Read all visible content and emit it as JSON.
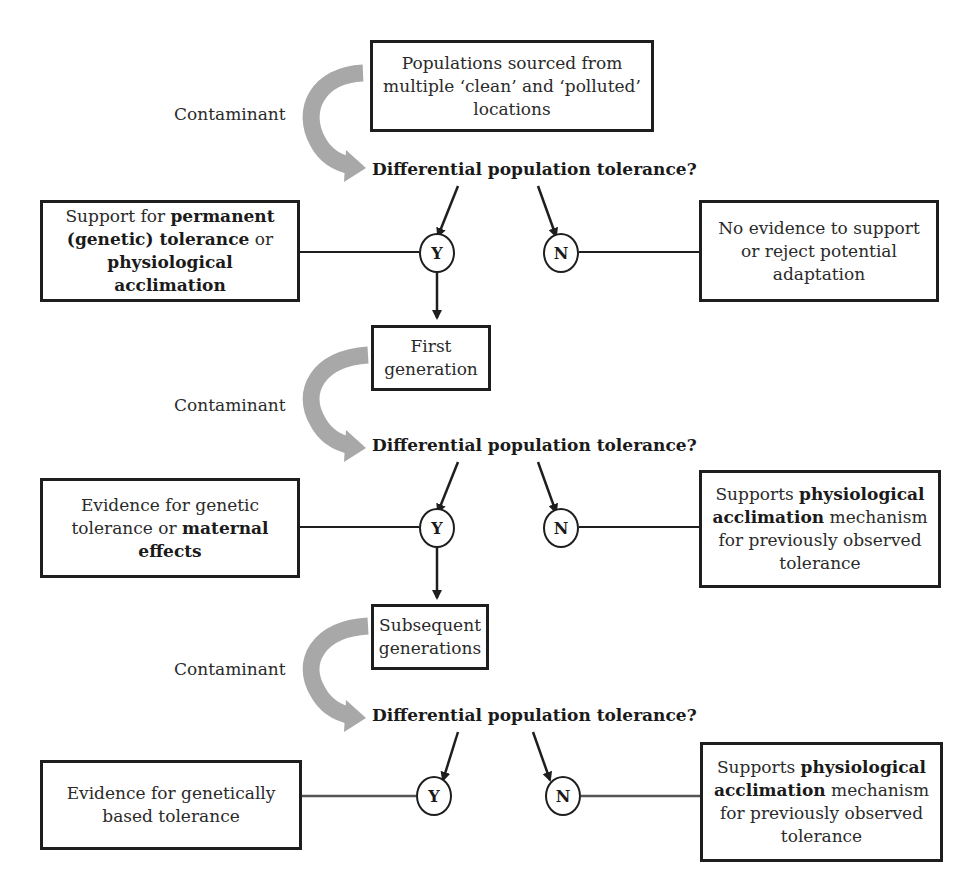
{
  "colors": {
    "line": "#1e1e1e",
    "curved_arrow": "#a8a8a8",
    "text": "#2a2a2a",
    "background": "#ffffff"
  },
  "stages": [
    {
      "source_box": {
        "parts": [
          {
            "text": "Populations sourced from multiple ‘clean’ and ‘polluted’ locations",
            "bold": false
          }
        ]
      },
      "treatment_label": "Contaminant",
      "question": "Differential population tolerance?",
      "yes_node": "Y",
      "no_node": "N",
      "yes_outcome": {
        "parts": [
          {
            "text": "Support for ",
            "bold": false
          },
          {
            "text": "permanent (genetic) tolerance",
            "bold": true
          },
          {
            "text": " or ",
            "bold": false
          },
          {
            "text": "physiological acclimation",
            "bold": true
          }
        ]
      },
      "no_outcome": {
        "parts": [
          {
            "text": "No evidence to support or reject potential adaptation",
            "bold": false
          }
        ]
      }
    },
    {
      "source_box": {
        "parts": [
          {
            "text": "First generation",
            "bold": false
          }
        ]
      },
      "treatment_label": "Contaminant",
      "question": "Differential population tolerance?",
      "yes_node": "Y",
      "no_node": "N",
      "yes_outcome": {
        "parts": [
          {
            "text": "Evidence for genetic tolerance or ",
            "bold": false
          },
          {
            "text": "maternal effects",
            "bold": true
          }
        ]
      },
      "no_outcome": {
        "parts": [
          {
            "text": "Supports ",
            "bold": false
          },
          {
            "text": "physiological acclimation",
            "bold": true
          },
          {
            "text": " mechanism for previously observed tolerance",
            "bold": false
          }
        ]
      }
    },
    {
      "source_box": {
        "parts": [
          {
            "text": "Subsequent generations",
            "bold": false
          }
        ]
      },
      "treatment_label": "Contaminant",
      "question": "Differential population tolerance?",
      "yes_node": "Y",
      "no_node": "N",
      "yes_outcome": {
        "parts": [
          {
            "text": "Evidence for genetically based tolerance",
            "bold": false
          }
        ]
      },
      "no_outcome": {
        "parts": [
          {
            "text": "Supports ",
            "bold": false
          },
          {
            "text": "physiological acclimation",
            "bold": true
          },
          {
            "text": " mechanism for previously observed tolerance",
            "bold": false
          }
        ]
      }
    }
  ]
}
